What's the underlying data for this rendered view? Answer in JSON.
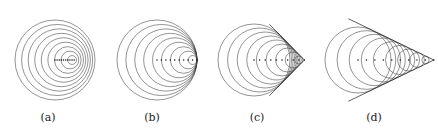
{
  "figure": {
    "title": "",
    "panels": [
      {
        "id": "a",
        "label": "(a)",
        "regime": "subsonic",
        "mach": 0.48,
        "center_x": 55,
        "label_x": 48,
        "waves": 9,
        "max_radius": 40,
        "dot_count": 9
      },
      {
        "id": "b",
        "label": "(b)",
        "regime": "sonic",
        "mach": 1.0,
        "center_x": 157,
        "label_x": 152,
        "waves": 9,
        "max_radius": 40,
        "dot_count": 9
      },
      {
        "id": "c",
        "label": "(c)",
        "regime": "supersonic",
        "mach": 1.4,
        "center_x": 254,
        "label_x": 257,
        "waves": 9,
        "max_radius": 36,
        "dot_count": 9
      },
      {
        "id": "d",
        "label": "(d)",
        "regime": "supersonic",
        "mach": 2.3,
        "center_x": 358,
        "label_x": 374,
        "waves": 9,
        "max_radius": 33,
        "dot_count": 9
      }
    ],
    "center_y": 60,
    "colors": {
      "wave": "#3a3a3a",
      "cone": "#1a1a1a",
      "dot": "#111111",
      "background": "#ffffff"
    }
  }
}
